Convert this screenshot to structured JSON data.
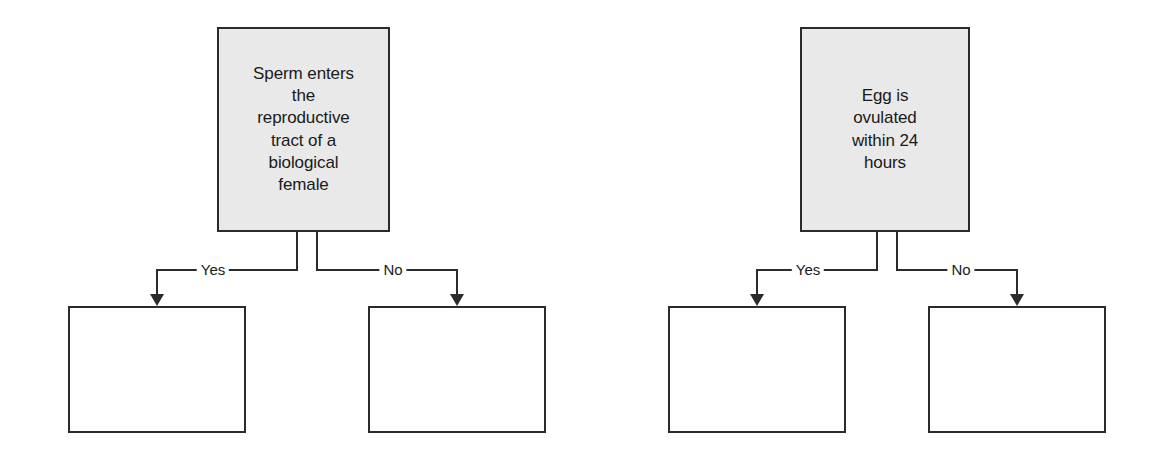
{
  "diagram": {
    "type": "flowchart",
    "orientation": "horizontal-pair",
    "branch_labels": {
      "yes": "Yes",
      "no": "No"
    },
    "colors": {
      "decision_fill": "#e9e9e9",
      "outcome_fill": "#ffffff",
      "stroke": "#2b2b2b",
      "text": "#1a1a1a",
      "background": "#ffffff"
    },
    "groups": [
      {
        "id": "group-sperm",
        "decision": {
          "text": "Sperm enters\nthe\nreproductive\ntract of a\nbiological\nfemale"
        },
        "branches": [
          {
            "label": "Yes",
            "outcome_text": ""
          },
          {
            "label": "No",
            "outcome_text": ""
          }
        ]
      },
      {
        "id": "group-egg",
        "decision": {
          "text": "Egg is\novulated\nwithin 24\nhours"
        },
        "branches": [
          {
            "label": "Yes",
            "outcome_text": ""
          },
          {
            "label": "No",
            "outcome_text": ""
          }
        ]
      }
    ]
  }
}
